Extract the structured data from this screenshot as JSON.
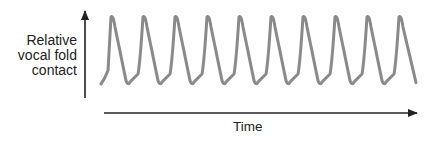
{
  "chart_data": {
    "type": "line",
    "title": "",
    "xlabel": "Time",
    "ylabel": "Relative vocal fold contact",
    "ylabel_lines": [
      "Relative",
      "vocal fold",
      "contact"
    ],
    "grid": false,
    "legend": null,
    "ticks": "none",
    "cycles": 10,
    "series": [
      {
        "name": "vocal fold contact",
        "color": "#8a8a8a",
        "points_relative": [
          [
            0,
            0.0
          ],
          [
            0.7,
            0.2
          ],
          [
            1.0,
            1.0
          ],
          [
            2.4,
            0.02
          ],
          [
            2.7,
            0.0
          ],
          [
            3.5,
            0.15
          ],
          [
            4.0,
            1.0
          ]
        ]
      }
    ],
    "waveform_color": "#8a8a8a",
    "axis_color": "#222222"
  }
}
